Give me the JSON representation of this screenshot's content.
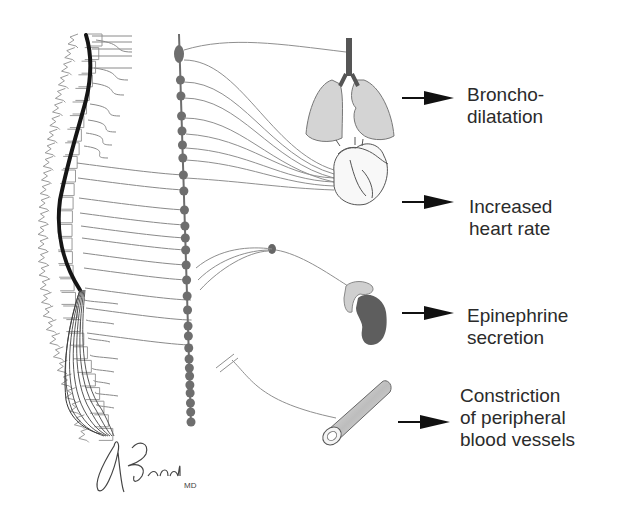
{
  "figure": {
    "colors": {
      "nerve": "#8a8a8a",
      "spinal_cord": "#151515",
      "ganglion": "#6e6e6e",
      "lung_fill": "#d4d4d4",
      "adrenal_cortex": "#cfcfcf",
      "kidney": "#5e5e5e",
      "arrow": "#111111",
      "text": "#2b2b2b"
    }
  },
  "effects": [
    {
      "organ": "lungs",
      "organ_icon": "lungs-icon",
      "lines": [
        "Broncho-",
        "dilatation"
      ]
    },
    {
      "organ": "heart",
      "organ_icon": "heart-icon",
      "lines": [
        "Increased",
        "heart rate"
      ]
    },
    {
      "organ": "adrenal-gland",
      "organ_icon": "adrenal-kidney-icon",
      "lines": [
        "Epinephrine",
        "secretion"
      ]
    },
    {
      "organ": "blood-vessel",
      "organ_icon": "blood-vessel-icon",
      "lines": [
        "Constriction",
        "of peripheral",
        "blood vessels"
      ]
    }
  ],
  "signature": {
    "name": "ABrada",
    "suffix": "MD"
  }
}
